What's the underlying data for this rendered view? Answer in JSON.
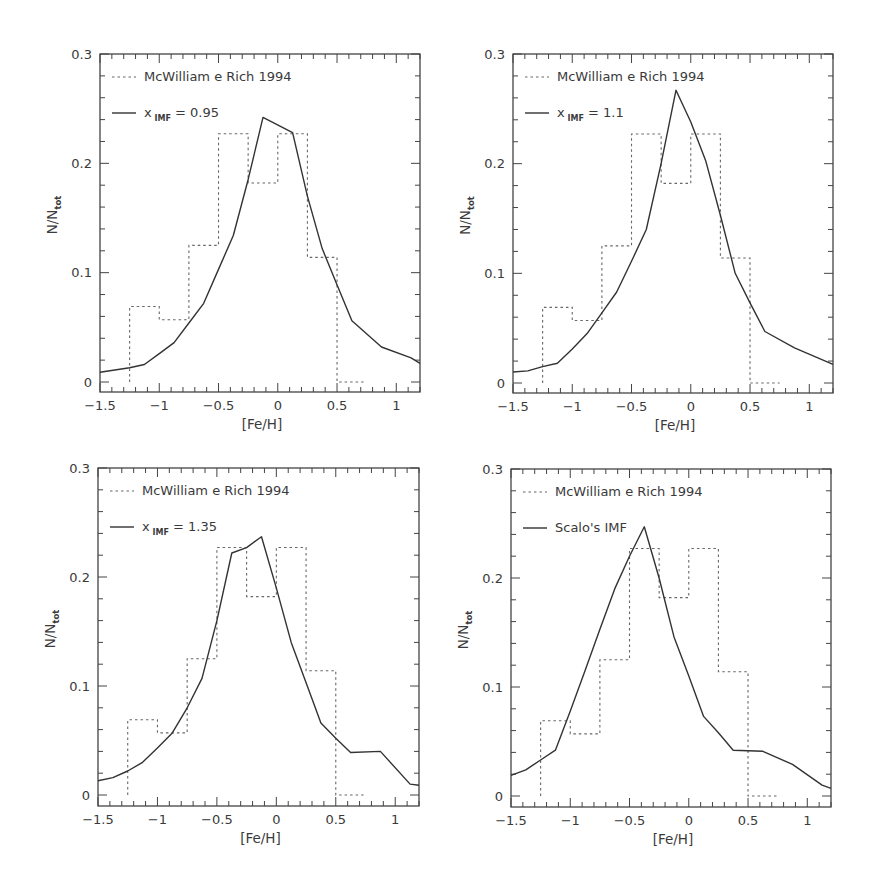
{
  "chart_data": [
    {
      "type": "line",
      "panel": "top-left",
      "title": "",
      "xlabel": "[Fe/H]",
      "ylabel": "N/N_tot",
      "xlim": [
        -1.5,
        1.2
      ],
      "ylim": [
        -0.01,
        0.3
      ],
      "xticks": [
        -1.5,
        -1,
        -0.5,
        0,
        0.5,
        1
      ],
      "xtick_labels": [
        "-1.5",
        "-1",
        "-0.5",
        "0",
        "0.5",
        "1"
      ],
      "yticks": [
        0,
        0.1,
        0.2,
        0.3
      ],
      "ytick_labels": [
        "0",
        "0.1",
        "0.2",
        "0.3"
      ],
      "grid": false,
      "legend_position": "upper left",
      "legend": [
        "McWilliam e Rich 1994",
        "x_IMF = 0.95"
      ],
      "series": [
        {
          "name": "McWilliam e Rich 1994",
          "style": "dotted-histogram",
          "bin_edges": [
            -1.25,
            -1.0,
            -0.75,
            -0.5,
            -0.25,
            0.0,
            0.25,
            0.5,
            0.75
          ],
          "values": [
            0.069,
            0.057,
            0.125,
            0.227,
            0.182,
            0.227,
            0.114,
            0.0
          ]
        },
        {
          "name": "x_IMF = 0.95",
          "style": "solid",
          "x": [
            -1.5,
            -1.25,
            -1.125,
            -1.0,
            -0.875,
            -0.75,
            -0.625,
            -0.5,
            -0.375,
            -0.25,
            -0.125,
            0.125,
            0.25,
            0.375,
            0.5,
            0.625,
            0.875,
            1.125,
            1.2
          ],
          "y": [
            0.009,
            0.013,
            0.016,
            0.026,
            0.036,
            0.054,
            0.072,
            0.103,
            0.134,
            0.185,
            0.242,
            0.228,
            0.17,
            0.122,
            0.089,
            0.056,
            0.032,
            0.022,
            0.017
          ]
        }
      ]
    },
    {
      "type": "line",
      "panel": "top-right",
      "title": "",
      "xlabel": "[Fe/H]",
      "ylabel": "N/N_tot",
      "xlim": [
        -1.5,
        1.2
      ],
      "ylim": [
        -0.01,
        0.3
      ],
      "xticks": [
        -1.5,
        -1,
        -0.5,
        0,
        0.5,
        1
      ],
      "xtick_labels": [
        "-1.5",
        "-1",
        "-0.5",
        "0",
        "0.5",
        "1"
      ],
      "yticks": [
        0,
        0.1,
        0.2,
        0.3
      ],
      "ytick_labels": [
        "0",
        "0.1",
        "0.2",
        "0.3"
      ],
      "grid": false,
      "legend_position": "upper left",
      "legend": [
        "McWilliam e Rich 1994",
        "x_IMF = 1.1"
      ],
      "series": [
        {
          "name": "McWilliam e Rich 1994",
          "style": "dotted-histogram",
          "bin_edges": [
            -1.25,
            -1.0,
            -0.75,
            -0.5,
            -0.25,
            0.0,
            0.25,
            0.5,
            0.75
          ],
          "values": [
            0.069,
            0.057,
            0.125,
            0.227,
            0.182,
            0.227,
            0.114,
            0.0
          ]
        },
        {
          "name": "x_IMF = 1.1",
          "style": "solid",
          "x": [
            -1.5,
            -1.375,
            -1.25,
            -1.125,
            -1.0,
            -0.875,
            -0.75,
            -0.625,
            -0.5,
            -0.375,
            -0.25,
            -0.125,
            0.0,
            0.125,
            0.25,
            0.375,
            0.5,
            0.625,
            0.875,
            1.2
          ],
          "y": [
            0.01,
            0.011,
            0.015,
            0.018,
            0.031,
            0.045,
            0.064,
            0.083,
            0.111,
            0.14,
            0.2,
            0.267,
            0.238,
            0.203,
            0.153,
            0.1,
            0.073,
            0.047,
            0.032,
            0.017
          ]
        }
      ]
    },
    {
      "type": "line",
      "panel": "bottom-left",
      "title": "",
      "xlabel": "[Fe/H]",
      "ylabel": "N/N_tot",
      "xlim": [
        -1.5,
        1.2
      ],
      "ylim": [
        -0.01,
        0.3
      ],
      "xticks": [
        -1.5,
        -1,
        -0.5,
        0,
        0.5,
        1
      ],
      "xtick_labels": [
        "-1.5",
        "-1",
        "-0.5",
        "0",
        "0.5",
        "1"
      ],
      "yticks": [
        0,
        0.1,
        0.2,
        0.3
      ],
      "ytick_labels": [
        "0",
        "0.1",
        "0.2",
        "0.3"
      ],
      "grid": false,
      "legend_position": "upper left",
      "legend": [
        "McWilliam e Rich 1994",
        "x_IMF = 1.35"
      ],
      "series": [
        {
          "name": "McWilliam e Rich 1994",
          "style": "dotted-histogram",
          "bin_edges": [
            -1.25,
            -1.0,
            -0.75,
            -0.5,
            -0.25,
            0.0,
            0.25,
            0.5,
            0.75
          ],
          "values": [
            0.069,
            0.057,
            0.125,
            0.227,
            0.182,
            0.227,
            0.114,
            0.0
          ]
        },
        {
          "name": "x_IMF = 1.35",
          "style": "solid",
          "x": [
            -1.5,
            -1.375,
            -1.25,
            -1.125,
            -1.0,
            -0.875,
            -0.75,
            -0.625,
            -0.5,
            -0.375,
            -0.25,
            -0.125,
            0.0,
            0.125,
            0.25,
            0.375,
            0.5,
            0.625,
            0.875,
            1.125,
            1.2
          ],
          "y": [
            0.013,
            0.016,
            0.022,
            0.03,
            0.043,
            0.057,
            0.08,
            0.107,
            0.16,
            0.222,
            0.227,
            0.237,
            0.19,
            0.14,
            0.103,
            0.066,
            0.052,
            0.039,
            0.04,
            0.01,
            0.009
          ]
        }
      ]
    },
    {
      "type": "line",
      "panel": "bottom-right",
      "title": "",
      "xlabel": "[Fe/H]",
      "ylabel": "N/N_tot",
      "xlim": [
        -1.5,
        1.2
      ],
      "ylim": [
        -0.01,
        0.3
      ],
      "xticks": [
        -1.5,
        -1,
        -0.5,
        0,
        0.5,
        1
      ],
      "xtick_labels": [
        "-1.5",
        "-1",
        "-0.5",
        "0",
        "0.5",
        "1"
      ],
      "yticks": [
        0,
        0.1,
        0.2,
        0.3
      ],
      "ytick_labels": [
        "0",
        "0.1",
        "0.2",
        "0.3"
      ],
      "grid": false,
      "legend_position": "upper left",
      "legend": [
        "McWilliam e Rich 1994",
        "Scalo's IMF"
      ],
      "series": [
        {
          "name": "McWilliam e Rich 1994",
          "style": "dotted-histogram",
          "bin_edges": [
            -1.25,
            -1.0,
            -0.75,
            -0.5,
            -0.25,
            0.0,
            0.25,
            0.5,
            0.75
          ],
          "values": [
            0.069,
            0.057,
            0.125,
            0.227,
            0.182,
            0.227,
            0.114,
            0.0
          ]
        },
        {
          "name": "Scalo's IMF",
          "style": "solid",
          "x": [
            -1.5,
            -1.375,
            -1.25,
            -1.125,
            -1.0,
            -0.875,
            -0.75,
            -0.625,
            -0.5,
            -0.375,
            -0.25,
            -0.125,
            0.0,
            0.125,
            0.25,
            0.375,
            0.625,
            0.875,
            1.125,
            1.2
          ],
          "y": [
            0.019,
            0.024,
            0.033,
            0.042,
            0.078,
            0.115,
            0.153,
            0.19,
            0.22,
            0.247,
            0.2,
            0.146,
            0.11,
            0.073,
            0.058,
            0.042,
            0.041,
            0.029,
            0.01,
            0.007
          ]
        }
      ]
    }
  ],
  "panels": [
    {
      "id": "top-left",
      "frame": {
        "left": 100,
        "right": 420,
        "top": 54,
        "bottom": 392,
        "y0_px": 382,
        "y03_px": 54
      },
      "legend": {
        "hist_label": "McWilliam e Rich 1994",
        "model_main": "x",
        "model_sub": "IMF",
        "model_rest": " = 0.95"
      },
      "ylabel_main": "N/N",
      "ylabel_sub": "tot",
      "xlabel": "[Fe/H]"
    },
    {
      "id": "top-right",
      "frame": {
        "left": 513,
        "right": 833,
        "top": 54,
        "bottom": 393,
        "y0_px": 383,
        "y03_px": 54
      },
      "legend": {
        "hist_label": "McWilliam e Rich 1994",
        "model_main": "x",
        "model_sub": "IMF",
        "model_rest": " = 1.1"
      },
      "ylabel_main": "N/N",
      "ylabel_sub": "tot",
      "xlabel": "[Fe/H]"
    },
    {
      "id": "bottom-left",
      "frame": {
        "left": 98,
        "right": 419,
        "top": 468,
        "bottom": 806,
        "y0_px": 795,
        "y03_px": 468
      },
      "legend": {
        "hist_label": "McWilliam e Rich 1994",
        "model_main": "x",
        "model_sub": "IMF",
        "model_rest": " = 1.35"
      },
      "ylabel_main": "N/N",
      "ylabel_sub": "tot",
      "xlabel": "[Fe/H]"
    },
    {
      "id": "bottom-right",
      "frame": {
        "left": 511,
        "right": 831,
        "top": 469,
        "bottom": 807,
        "y0_px": 796,
        "y03_px": 469
      },
      "legend": {
        "hist_label": "McWilliam e Rich 1994",
        "model_main": "Scalo's IMF",
        "model_sub": "",
        "model_rest": ""
      },
      "ylabel_main": "N/N",
      "ylabel_sub": "tot",
      "xlabel": "[Fe/H]"
    }
  ]
}
